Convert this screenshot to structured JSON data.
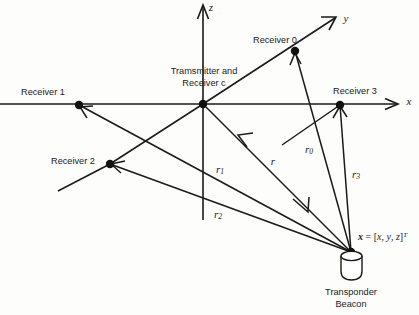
{
  "figure": {
    "kind": "tdoa-transponder-geometry-diagram",
    "background_color": "#fdfdfc",
    "ink_color": "#1a1a1a"
  },
  "axes": {
    "x_label": "x",
    "y_label": "y",
    "z_label": "z"
  },
  "nodes": {
    "origin_label_line1": "Tramsmitter and",
    "origin_label_line2": "Receiver c",
    "receiver0": "Receiver 0",
    "receiver1": "Receiver 1",
    "receiver2": "Receiver 2",
    "receiver3": "Receiver 3"
  },
  "ranges": {
    "r": "r",
    "r0_base": "r",
    "r0_sub": "0",
    "r1_base": "r",
    "r1_sub": "1",
    "r2_base": "r",
    "r2_sub": "2",
    "r3_base": "r",
    "r3_sub": "3"
  },
  "beacon": {
    "vector_symbol": "x",
    "vector_equals": " = [",
    "vector_x": "x",
    "vector_comma1": ", ",
    "vector_y": "y",
    "vector_comma2": ", ",
    "vector_z": "z",
    "vector_close": "]",
    "vector_transpose": "T",
    "caption_line1": "Transponder",
    "caption_line2": "Beacon"
  }
}
